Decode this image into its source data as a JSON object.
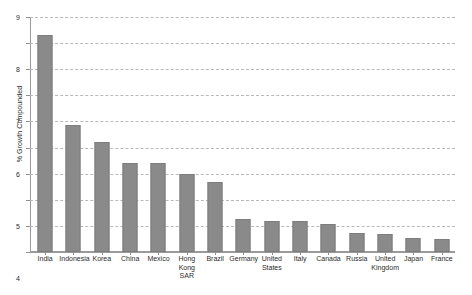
{
  "chart_data": {
    "type": "bar",
    "title": "",
    "subtitle": "",
    "xlabel": "",
    "ylabel": "% Growth Compounded",
    "ylim": [
      0,
      9
    ],
    "ytick_step": 1,
    "yticks": [
      "0",
      "1",
      "2",
      "3",
      "4",
      "5",
      "6",
      "7",
      "8",
      "9"
    ],
    "grid": true,
    "grid_style": "dashed-horizontal",
    "legend": null,
    "legend_position": "none",
    "orientation": "vertical",
    "bar_color": "#8a8a8a",
    "bar_edge_color": "#7d7d7d",
    "background_color": "#ffffff",
    "axis_color": "#9a9a9a",
    "gridline_color": "#b9b9b9",
    "categories": [
      "India",
      "Indonesia",
      "Korea",
      "China",
      "Mexico",
      "Hong Kong SAR",
      "Brazil",
      "Germany",
      "United States",
      "Italy",
      "Canada",
      "Russia",
      "United Kingdom",
      "Japan",
      "France"
    ],
    "category_labels_wrapped": [
      "India",
      "Indonesia",
      "Korea",
      "China",
      "Mexico",
      "Hong\nKong\nSAR",
      "Brazil",
      "Germany",
      "United\nStates",
      "Italy",
      "Canada",
      "Russia",
      "United\nKingdom",
      "Japan",
      "France"
    ],
    "values": [
      8.3,
      4.85,
      4.2,
      3.4,
      3.4,
      2.97,
      2.7,
      1.28,
      1.18,
      1.17,
      1.08,
      0.72,
      0.7,
      0.55,
      0.48
    ],
    "series": [
      {
        "name": "% Growth Compounded",
        "values": [
          8.3,
          4.85,
          4.2,
          3.4,
          3.4,
          2.97,
          2.7,
          1.28,
          1.18,
          1.17,
          1.08,
          0.72,
          0.7,
          0.55,
          0.48
        ]
      }
    ]
  }
}
